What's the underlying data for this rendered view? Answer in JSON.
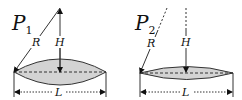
{
  "panels": [
    {
      "id": "P1",
      "title_main": "P",
      "title_sub": "1",
      "radius_label": "R",
      "height_label": "H",
      "length_label": "L",
      "lens_fill": "#d3d3d3"
    },
    {
      "id": "P2",
      "title_main": "P",
      "title_sub": "2",
      "radius_label": "R",
      "height_label": "H",
      "length_label": "L",
      "lens_fill": "#d3d3d3"
    }
  ]
}
